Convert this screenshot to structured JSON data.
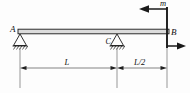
{
  "diagram": {
    "type": "beam-free-body-diagram",
    "line_color": "#1a1a1a",
    "beam_fill": "#d9d9d9",
    "background": "#fdfdfd",
    "labels": {
      "support_a": "A",
      "support_c": "C",
      "joint_b": "B",
      "moment": "m",
      "span_main": "L",
      "span_overhang": "L/2"
    },
    "supports": [
      {
        "name": "A",
        "label": "A",
        "kind": "pinned-hatched",
        "x": 20,
        "y": 34
      },
      {
        "name": "C",
        "label": "C",
        "kind": "pinned-hatched",
        "x": 117,
        "y": 34
      }
    ],
    "loads": [
      {
        "name": "moment-arrow",
        "label": "m",
        "direction": "left",
        "x_from": 167,
        "x_to": 141,
        "y": 9
      },
      {
        "name": "reaction-arrow",
        "label": "",
        "direction": "right",
        "x_from": 167,
        "x_to": 184,
        "y": 46
      }
    ],
    "dimensions": [
      {
        "name": "dim-L",
        "label": "L",
        "x_from": 20,
        "x_to": 117,
        "y": 68
      },
      {
        "name": "dim-L-half",
        "label": "L/2",
        "x_from": 117,
        "x_to": 167,
        "y": 68
      }
    ],
    "beam": {
      "x_from": 18,
      "x_to": 169,
      "y_top": 29,
      "y_bottom": 34
    },
    "column": {
      "x": 167,
      "y_from": 9,
      "y_to": 46
    }
  }
}
